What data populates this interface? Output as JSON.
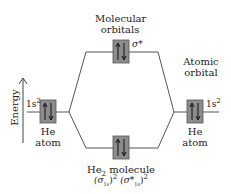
{
  "diagram": {
    "type": "molecular-orbital-diagram",
    "axis": {
      "label": "Energy",
      "direction": "up"
    },
    "labels": {
      "mo_title_line1": "Molecular",
      "mo_title_line2": "orbitals",
      "ao_title_line1": "Atomic",
      "ao_title_line2": "orbital",
      "antibonding": "σ*",
      "left_config": "1s",
      "left_config_sup": "2",
      "right_config": "1s",
      "right_config_sup": "2",
      "left_atom_line1": "He",
      "left_atom_line2": "atom",
      "right_atom_line1": "He",
      "right_atom_line2": "atom",
      "molecule_name": "He",
      "molecule_sub": "2",
      "molecule_word": " molecule",
      "config_p1": "(σ",
      "config_s1": "1s",
      "config_c1": ")",
      "config_e1": "2",
      "config_p2": " (σ*",
      "config_s2": "1s",
      "config_c2": ")",
      "config_e2": "2"
    },
    "orbitals": [
      {
        "name": "He atom 1s (left)",
        "electrons": 2,
        "spins": [
          "up",
          "down"
        ]
      },
      {
        "name": "σ* antibonding",
        "electrons": 2,
        "spins": [
          "up",
          "down"
        ]
      },
      {
        "name": "σ1s bonding",
        "electrons": 2,
        "spins": [
          "up",
          "down"
        ]
      },
      {
        "name": "He atom 1s (right)",
        "electrons": 2,
        "spins": [
          "up",
          "down"
        ]
      }
    ],
    "colors": {
      "box_fill": "#8c8c8c",
      "line": "#555555",
      "text": "#222222"
    }
  }
}
